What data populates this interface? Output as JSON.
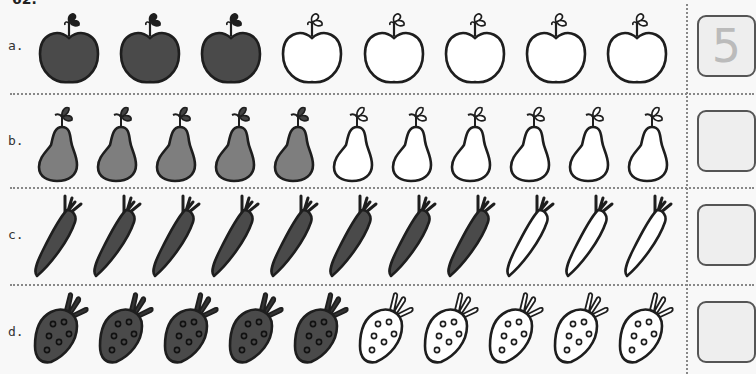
{
  "page": {
    "number_partial": "62."
  },
  "colors": {
    "dark_fill": "#4a4a4a",
    "pear_fill": "#7e7e7e",
    "outline": "#1e1e1e",
    "blank": "#ffffff"
  },
  "rows": [
    {
      "label": "a.",
      "item": "apple",
      "filled": 3,
      "outline": 5,
      "answer": "5"
    },
    {
      "label": "b.",
      "item": "pear",
      "filled": 5,
      "outline": 6,
      "answer": ""
    },
    {
      "label": "c.",
      "item": "carrot",
      "filled": 8,
      "outline": 3,
      "answer": ""
    },
    {
      "label": "d.",
      "item": "strawberry",
      "filled": 5,
      "outline": 5,
      "answer": ""
    }
  ]
}
